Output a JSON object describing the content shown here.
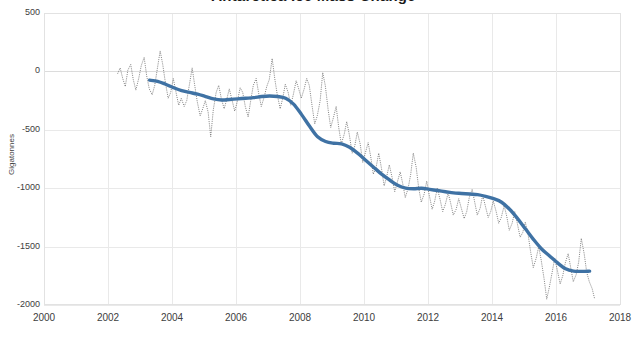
{
  "chart_data": {
    "type": "line",
    "title": "Antarctica Ice Mass Change",
    "xlabel": "",
    "ylabel": "Gigatonnes",
    "xlim": [
      2000,
      2018
    ],
    "ylim": [
      -2000,
      500
    ],
    "x_ticks": [
      2000,
      2002,
      2004,
      2006,
      2008,
      2010,
      2012,
      2014,
      2016,
      2018
    ],
    "y_ticks": [
      500,
      0,
      -500,
      -1000,
      -1500,
      -2000
    ],
    "grid": true,
    "legend": "none",
    "series": [
      {
        "name": "Monthly ice mass anomaly",
        "style": "dotted-thin",
        "color": "#555555",
        "x": [
          2002.3,
          2002.38,
          2002.46,
          2002.54,
          2002.62,
          2002.71,
          2002.79,
          2002.87,
          2002.96,
          2003.04,
          2003.13,
          2003.21,
          2003.29,
          2003.38,
          2003.46,
          2003.54,
          2003.63,
          2003.71,
          2003.79,
          2003.88,
          2003.96,
          2004.04,
          2004.13,
          2004.21,
          2004.29,
          2004.38,
          2004.46,
          2004.54,
          2004.63,
          2004.71,
          2004.79,
          2004.88,
          2004.96,
          2005.04,
          2005.13,
          2005.21,
          2005.29,
          2005.38,
          2005.46,
          2005.54,
          2005.63,
          2005.71,
          2005.79,
          2005.88,
          2005.96,
          2006.04,
          2006.13,
          2006.21,
          2006.29,
          2006.38,
          2006.46,
          2006.54,
          2006.63,
          2006.71,
          2006.79,
          2006.88,
          2006.96,
          2007.04,
          2007.13,
          2007.21,
          2007.29,
          2007.38,
          2007.46,
          2007.54,
          2007.63,
          2007.71,
          2007.79,
          2007.88,
          2007.96,
          2008.04,
          2008.13,
          2008.21,
          2008.29,
          2008.38,
          2008.46,
          2008.54,
          2008.63,
          2008.71,
          2008.79,
          2008.88,
          2008.96,
          2009.04,
          2009.13,
          2009.21,
          2009.29,
          2009.38,
          2009.46,
          2009.54,
          2009.63,
          2009.71,
          2009.79,
          2009.88,
          2009.96,
          2010.04,
          2010.13,
          2010.21,
          2010.29,
          2010.38,
          2010.46,
          2010.54,
          2010.63,
          2010.71,
          2010.79,
          2010.88,
          2010.96,
          2011.04,
          2011.13,
          2011.21,
          2011.29,
          2011.38,
          2011.46,
          2011.54,
          2011.63,
          2011.71,
          2011.79,
          2011.88,
          2011.96,
          2012.04,
          2012.13,
          2012.21,
          2012.29,
          2012.38,
          2012.46,
          2012.54,
          2012.63,
          2012.71,
          2012.79,
          2012.88,
          2012.96,
          2013.04,
          2013.13,
          2013.21,
          2013.29,
          2013.38,
          2013.46,
          2013.54,
          2013.63,
          2013.71,
          2013.79,
          2013.88,
          2013.96,
          2014.04,
          2014.13,
          2014.21,
          2014.29,
          2014.38,
          2014.46,
          2014.54,
          2014.63,
          2014.71,
          2014.79,
          2014.88,
          2014.96,
          2015.04,
          2015.13,
          2015.21,
          2015.29,
          2015.38,
          2015.46,
          2015.54,
          2015.63,
          2015.71,
          2015.79,
          2015.88,
          2015.96,
          2016.04,
          2016.13,
          2016.21,
          2016.29,
          2016.38,
          2016.46,
          2016.54,
          2016.63,
          2016.71,
          2016.79,
          2016.88,
          2016.96,
          2017.04,
          2017.13,
          2017.21
        ],
        "y": [
          -20,
          30,
          -60,
          -130,
          10,
          60,
          -70,
          -160,
          -60,
          50,
          120,
          -40,
          -150,
          -200,
          -120,
          20,
          175,
          60,
          -90,
          -230,
          -180,
          -60,
          -185,
          -290,
          -230,
          -300,
          -250,
          -120,
          30,
          -120,
          -260,
          -380,
          -320,
          -250,
          -350,
          -560,
          -330,
          -180,
          -120,
          -230,
          -320,
          -240,
          -150,
          -250,
          -340,
          -260,
          -140,
          -180,
          -300,
          -390,
          -250,
          -120,
          -60,
          -190,
          -300,
          -220,
          -130,
          -70,
          110,
          -60,
          -200,
          -320,
          -230,
          -110,
          -180,
          -290,
          -200,
          -80,
          -150,
          -230,
          -150,
          -60,
          -120,
          -300,
          -450,
          -380,
          -250,
          -10,
          -120,
          -330,
          -480,
          -400,
          -300,
          -480,
          -620,
          -540,
          -430,
          -540,
          -700,
          -640,
          -520,
          -620,
          -780,
          -700,
          -610,
          -730,
          -880,
          -820,
          -700,
          -820,
          -980,
          -900,
          -800,
          -910,
          -1030,
          -950,
          -860,
          -960,
          -1080,
          -1000,
          -880,
          -700,
          -820,
          -1000,
          -1120,
          -1050,
          -940,
          -1060,
          -1180,
          -1110,
          -1000,
          -1100,
          -1200,
          -1140,
          -1040,
          -1130,
          -1230,
          -1180,
          -1090,
          -1170,
          -1260,
          -1200,
          -1080,
          -1010,
          -1120,
          -1230,
          -1170,
          -1060,
          -1150,
          -1250,
          -1200,
          -1110,
          -1200,
          -1300,
          -1250,
          -1150,
          -1240,
          -1360,
          -1300,
          -1200,
          -1300,
          -1420,
          -1380,
          -1290,
          -1400,
          -1550,
          -1680,
          -1600,
          -1500,
          -1620,
          -1780,
          -1950,
          -1850,
          -1720,
          -1600,
          -1700,
          -1820,
          -1750,
          -1640,
          -1560,
          -1680,
          -1800,
          -1740,
          -1630,
          -1430,
          -1560,
          -1720,
          -1800,
          -1860,
          -1950
        ]
      },
      {
        "name": "Smoothed trend (running mean)",
        "style": "thick-solid",
        "color": "#3f72a4",
        "x": [
          2003.3,
          2003.55,
          2003.8,
          2004.05,
          2004.3,
          2004.55,
          2004.8,
          2005.05,
          2005.3,
          2005.55,
          2005.8,
          2006.05,
          2006.3,
          2006.55,
          2006.8,
          2007.05,
          2007.3,
          2007.55,
          2007.8,
          2008.05,
          2008.3,
          2008.55,
          2008.8,
          2009.05,
          2009.3,
          2009.55,
          2009.8,
          2010.05,
          2010.3,
          2010.55,
          2010.8,
          2011.05,
          2011.3,
          2011.55,
          2011.8,
          2012.05,
          2012.3,
          2012.55,
          2012.8,
          2013.05,
          2013.3,
          2013.55,
          2013.8,
          2014.05,
          2014.3,
          2014.55,
          2014.8,
          2015.05,
          2015.3,
          2015.55,
          2015.8,
          2016.05,
          2016.3,
          2016.55,
          2016.8,
          2017.05
        ],
        "y": [
          -75,
          -85,
          -110,
          -140,
          -165,
          -180,
          -195,
          -215,
          -235,
          -245,
          -240,
          -235,
          -230,
          -225,
          -215,
          -210,
          -215,
          -230,
          -280,
          -370,
          -470,
          -560,
          -600,
          -615,
          -620,
          -650,
          -700,
          -760,
          -820,
          -880,
          -930,
          -975,
          -1000,
          -1005,
          -1000,
          -1010,
          -1020,
          -1030,
          -1040,
          -1045,
          -1050,
          -1055,
          -1070,
          -1090,
          -1120,
          -1180,
          -1260,
          -1350,
          -1440,
          -1520,
          -1580,
          -1640,
          -1690,
          -1710,
          -1712,
          -1710
        ]
      }
    ]
  },
  "axes": {
    "y_title": "Gigatonnes",
    "y_tick_labels": [
      "500",
      "0",
      "-500",
      "-1000",
      "-1500",
      "-2000"
    ],
    "x_tick_labels": [
      "2000",
      "2002",
      "2004",
      "2006",
      "2008",
      "2010",
      "2012",
      "2014",
      "2016",
      "2018"
    ]
  }
}
